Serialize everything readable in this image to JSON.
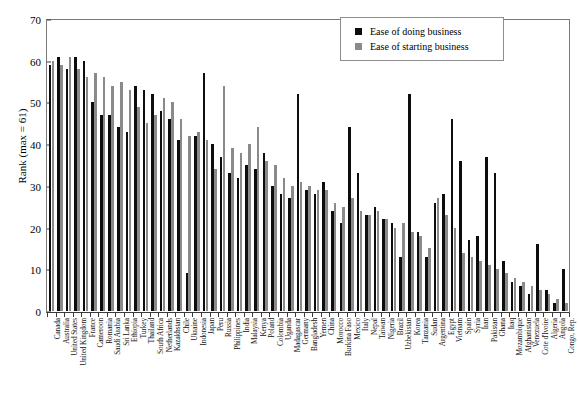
{
  "chart_data": {
    "type": "bar",
    "title": "",
    "xlabel": "",
    "ylabel": "Rank (max = 61)",
    "ylim": [
      0,
      70
    ],
    "ytick_step": 10,
    "yticks": [
      0,
      10,
      20,
      30,
      40,
      50,
      60,
      70
    ],
    "grid": false,
    "legend_position": "top-right",
    "colors": {
      "doing": "#0d0d0d",
      "starting": "#8a8a8a",
      "axis": "#3a3a3a",
      "background": "#ffffff"
    },
    "categories": [
      "Canada",
      "Australia",
      "United States",
      "United Kingdom",
      "France",
      "Cameroon",
      "Romania",
      "Saudi Arabia",
      "Sri Lanka",
      "Ethiopia",
      "Turkey",
      "Thailand",
      "South Africa",
      "Netherlands",
      "Kazakhstan",
      "Chile",
      "Ukraine",
      "Indonesia",
      "Japan",
      "Peru",
      "Russia",
      "Philippines",
      "India",
      "Malaysia",
      "Kenya",
      "Poland",
      "Colombia",
      "Uganda",
      "Madagascar",
      "Germany",
      "Bangladesh",
      "Yemen",
      "China",
      "Morocco",
      "Burkina Faso",
      "Mexico",
      "Italy",
      "Nepal",
      "Taiwan",
      "Nigeria",
      "Brazil",
      "Uzbekistan",
      "Korea",
      "Tanzania",
      "Sudan",
      "Argentina",
      "Egypt",
      "Vietnam",
      "Spain",
      "Syria",
      "Iran",
      "Pakistan",
      "Ghana",
      "Iraq",
      "Mozambique",
      "Afghanistan",
      "Venezuela",
      "Cote d'Ivoire",
      "Algeria",
      "Angola",
      "Congo, Rep."
    ],
    "series": [
      {
        "name": "Ease of doing business",
        "color": "#0d0d0d",
        "values": [
          59,
          61,
          58,
          61,
          60,
          50,
          47,
          47,
          44,
          43,
          54,
          53,
          52,
          48,
          46,
          41,
          9,
          42,
          57,
          40,
          37,
          33,
          32,
          35,
          34,
          38,
          30,
          28,
          27,
          52,
          29,
          28,
          31,
          24,
          21,
          44,
          33,
          23,
          25,
          22,
          21,
          13,
          52,
          19,
          13,
          26,
          28,
          46,
          36,
          17,
          18,
          37,
          33,
          12,
          7,
          6,
          4,
          16,
          5,
          2,
          10
        ]
      },
      {
        "name": "Ease of starting business",
        "color": "#8a8a8a",
        "values": [
          60,
          59,
          61,
          58,
          56,
          57,
          56,
          54,
          55,
          53,
          49,
          45,
          47,
          51,
          50,
          46,
          42,
          43,
          41,
          34,
          54,
          39,
          38,
          40,
          44,
          36,
          35,
          32,
          30,
          31,
          30,
          29,
          29,
          26,
          25,
          27,
          24,
          23,
          24,
          22,
          20,
          21,
          19,
          18,
          15,
          27,
          23,
          20,
          14,
          13,
          12,
          11,
          10,
          9,
          8,
          7,
          6,
          5,
          4,
          3,
          2
        ]
      }
    ]
  },
  "legend": {
    "items": [
      {
        "label": "Ease of doing business",
        "color": "#0d0d0d"
      },
      {
        "label": "Ease of starting business",
        "color": "#8a8a8a"
      }
    ]
  },
  "axes": {
    "y_title": "Rank (max = 61)"
  }
}
